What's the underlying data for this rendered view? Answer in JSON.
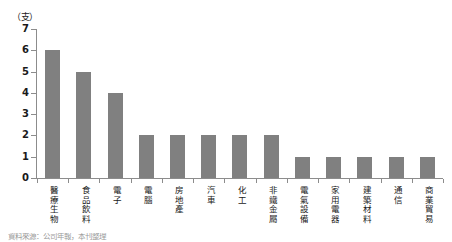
{
  "chart_data": {
    "type": "bar",
    "title": "",
    "subtitle": "",
    "xlabel": "",
    "ylabel": "",
    "unit_label": "（支）",
    "ylim": [
      0,
      7
    ],
    "y_ticks": [
      0,
      1,
      2,
      3,
      4,
      5,
      6,
      7
    ],
    "grid": false,
    "legend": null,
    "bar_color": "#808080",
    "axis_color": "#8c8c8c",
    "categories": [
      "醫療生物",
      "食品飲料",
      "電子",
      "電腦",
      "房地產",
      "汽車",
      "化工",
      "非鐵金屬",
      "電氣設備",
      "家用電器",
      "建築材料",
      "通信",
      "商業貿易"
    ],
    "values": [
      6,
      5,
      4,
      2,
      2,
      2,
      2,
      2,
      1,
      1,
      1,
      1,
      1
    ]
  },
  "caption": {
    "bottom_note": "資料來源：公司年報，本刊整理"
  }
}
